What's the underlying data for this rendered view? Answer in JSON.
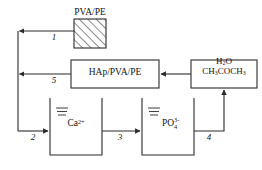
{
  "diagram": {
    "type": "process-flow",
    "canvas": {
      "width": 262,
      "height": 170
    },
    "stroke_color": "#2b2b2b",
    "text_color": "#141414",
    "background_color": "#ffffff",
    "nodes": [
      {
        "id": "pva-pe",
        "label": "PVA/PE",
        "shape": "hatched-rectangle",
        "hatch": "diagonal-45",
        "x": 74,
        "y": 19,
        "width": 32,
        "height": 29
      },
      {
        "id": "hap-pva-pe",
        "label": "HAp/PVA/PE",
        "shape": "rectangle",
        "x": 71,
        "y": 60,
        "width": 88,
        "height": 28
      },
      {
        "id": "solvent",
        "label_line1": "H2O",
        "label_line2": "CH3COCH3",
        "label_line1_html": "H<sub>2</sub>O",
        "label_line2_html": "CH<sub>3</sub>COCH<sub>3</sub>",
        "shape": "rectangle",
        "x": 191,
        "y": 60,
        "width": 66,
        "height": 28
      },
      {
        "id": "calcium-beaker",
        "label": "Ca2+",
        "label_base": "Ca",
        "label_charge": "2+",
        "shape": "beaker",
        "x": 50,
        "y": 98,
        "width": 52,
        "height": 57
      },
      {
        "id": "phosphate-beaker",
        "label": "PO43-",
        "label_base": "PO",
        "label_sub": "4",
        "label_sup": "3-",
        "shape": "beaker",
        "x": 142,
        "y": 98,
        "width": 52,
        "height": 57
      }
    ],
    "edges": [
      {
        "id": "edge-1",
        "label": "1",
        "from": "pva-pe",
        "to": "left-bus",
        "direction": "left"
      },
      {
        "id": "edge-2",
        "label": "2",
        "from": "left-bus",
        "to": "calcium-beaker",
        "direction": "right"
      },
      {
        "id": "edge-3",
        "label": "3",
        "from": "calcium-beaker",
        "to": "phosphate-beaker",
        "direction": "right"
      },
      {
        "id": "edge-4",
        "label": "4",
        "from": "phosphate-beaker",
        "to": "solvent",
        "direction": "up"
      },
      {
        "id": "edge-5",
        "label": "5",
        "from": "hap-pva-pe",
        "to": "left-bus",
        "direction": "left"
      },
      {
        "id": "edge-6",
        "label": "",
        "from": "solvent",
        "to": "hap-pva-pe",
        "direction": "left"
      }
    ],
    "edge_labels": {
      "one": "1",
      "two": "2",
      "three": "3",
      "four": "4",
      "five": "5"
    }
  }
}
